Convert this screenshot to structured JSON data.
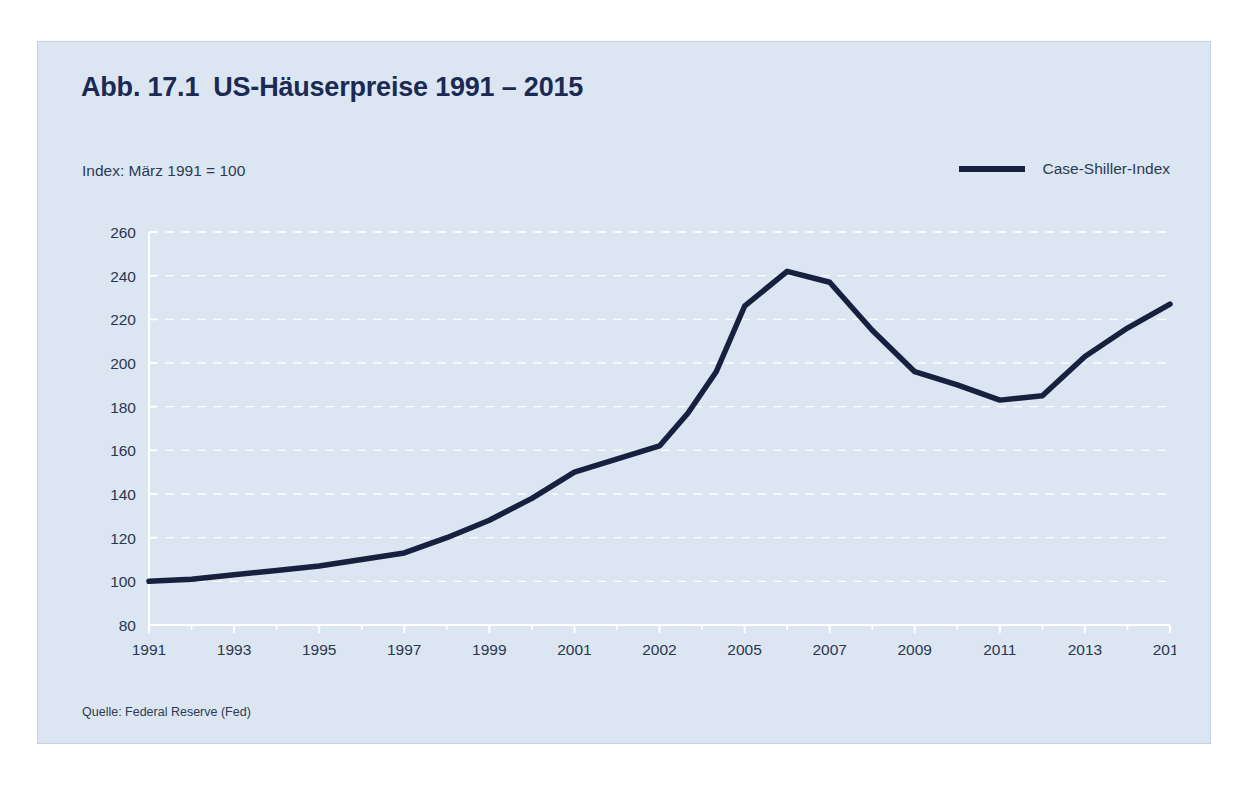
{
  "page": {
    "running_head": "",
    "background_color": "#ffffff"
  },
  "figure": {
    "number": "Abb. 17.1",
    "title": "US-Häuserpreise 1991 – 2015",
    "index_note": "Index: März 1991 = 100",
    "source": "Quelle: Federal Reserve (Fed)",
    "card_color": "#dce6f2",
    "title_color": "#1b2a54",
    "series_color": "#17213f",
    "grid_color": "#ffffff"
  },
  "legend": {
    "position": "top-right",
    "entries": [
      {
        "label": "Case-Shiller-Index",
        "color": "#17213f",
        "swatch": "line-swatch"
      }
    ]
  },
  "chart_data": {
    "type": "line",
    "subtitle": "Index: März 1991 = 100",
    "xlabel": "",
    "ylabel": "",
    "ylim": [
      80,
      260
    ],
    "ytick_step": 20,
    "yticks": [
      80,
      100,
      120,
      140,
      160,
      180,
      200,
      220,
      240,
      260
    ],
    "xticks": [
      "1991",
      "1993",
      "1995",
      "1997",
      "1999",
      "2001",
      "2002",
      "2005",
      "2007",
      "2009",
      "2011",
      "2013",
      "2015"
    ],
    "grid": "horizontal-dashed-white",
    "legend_position": "top-right",
    "series": [
      {
        "name": "Case-Shiller-Index",
        "color": "#17213f",
        "x": [
          "1991",
          "1992",
          "1993",
          "1994",
          "1995",
          "1996",
          "1997",
          "1998",
          "1999",
          "2000",
          "2001",
          "2002",
          "2003",
          "2004",
          "2005",
          "2006",
          "2007",
          "2008",
          "2009",
          "2010",
          "2011",
          "2012",
          "2013",
          "2014",
          "2015"
        ],
        "values": [
          100,
          101,
          103,
          105,
          107,
          110,
          113,
          120,
          128,
          138,
          150,
          162,
          177,
          196,
          226,
          242,
          237,
          215,
          196,
          190,
          183,
          185,
          203,
          216,
          227
        ]
      }
    ]
  }
}
